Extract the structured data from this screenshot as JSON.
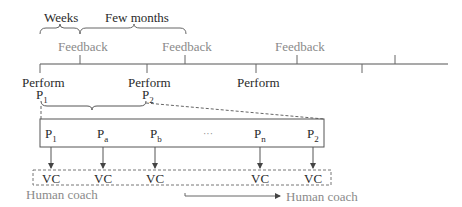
{
  "colors": {
    "ink": "#2a2a2a",
    "muted": "#8a8a8a",
    "line": "#555555"
  },
  "top_braces": {
    "weeks_label": "Weeks",
    "few_months_label": "Few months"
  },
  "timeline": {
    "feedback_labels": [
      "Feedback",
      "Feedback",
      "Feedback"
    ],
    "perform_labels": [
      "Perform",
      "Perform",
      "Perform"
    ],
    "period_labels": [
      {
        "base": "P",
        "sub": "1"
      },
      {
        "base": "P",
        "sub": "2"
      }
    ]
  },
  "expanded_box": {
    "items": [
      {
        "base": "P",
        "sub": "1"
      },
      {
        "base": "P",
        "sub": "a"
      },
      {
        "base": "P",
        "sub": "b"
      },
      {
        "base": "···",
        "sub": ""
      },
      {
        "base": "P",
        "sub": "n"
      },
      {
        "base": "P",
        "sub": "2"
      }
    ]
  },
  "vc_row": {
    "labels": [
      "VC",
      "VC",
      "VC",
      "VC",
      "VC"
    ]
  },
  "human_coach": {
    "left_label": "Human coach",
    "right_label": "Human coach"
  }
}
